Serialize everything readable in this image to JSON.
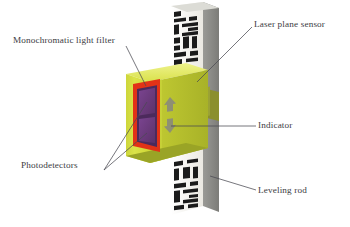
{
  "figure": {
    "background_color": "#ffffff",
    "width": 350,
    "height": 227
  },
  "labels": {
    "monochromatic_light_filter": "Monochromatic light filter",
    "photodetectors": "Photodetectors",
    "laser_plane_sensor": "Laser plane sensor",
    "indicator": "Indicator",
    "leveling_rod": "Leveling rod"
  },
  "colors": {
    "label_text": "#3b3b42",
    "leader_line": "#4a4a52",
    "sensor_body_yellow": "#d9e140",
    "sensor_body_shadow": "#aab32c",
    "sensor_top_highlight": "#e8ee76",
    "filter_red": "#e23217",
    "photodetector_purple": "#6e3c7d",
    "indicator_arrow_grey": "#8e8f74",
    "rod_face_white": "#f2f1ec",
    "rod_side_grey": "#8b8b88",
    "rod_mark_black": "#1b1b1b",
    "clamp_olive": "#8b8f2e"
  },
  "rod_markings": {
    "description": "Barcode-style leveling rod graduations with rotated numerals",
    "top_digits": [
      "3",
      "10"
    ],
    "bottom_digits": [
      "06",
      "073"
    ]
  },
  "indicators": {
    "up_arrow": "arrow-up",
    "down_arrow": "arrow-down",
    "count": 2
  },
  "photodetector_elements": {
    "count": 2,
    "shape": "rectangle"
  }
}
